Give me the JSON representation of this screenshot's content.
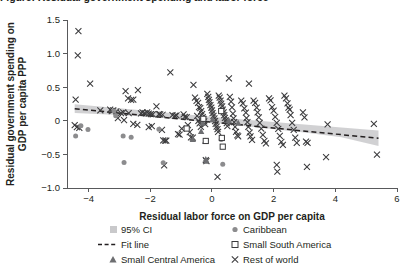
{
  "figure": {
    "title_partial": "Figure: Residual government spending and labor force",
    "background": "#ffffff"
  },
  "colors": {
    "ci_band": "#c9c9cb",
    "fit_line": "#231f20",
    "caribbean": "#8c8c8e",
    "small_central_america": "#6d6e71",
    "small_south_america": "#ffffff",
    "rest_of_world": "#3b3b3d",
    "axis": "#58595b",
    "text": "#231f20"
  },
  "axes": {
    "x": {
      "label": "Residual labor force on GDP per capita",
      "ticks": [
        "−4",
        "−2",
        "0",
        "2",
        "4",
        "6"
      ],
      "tick_values": [
        -4,
        -2,
        0,
        2,
        4,
        6
      ],
      "min": -4.7,
      "max": 6.0
    },
    "y": {
      "label_line1": "Residual government spending on",
      "label_line2": "GDP per capita PPP",
      "ticks": [
        "1.5",
        "1.0",
        "0.5",
        "0",
        "−0.5",
        "−1.0"
      ],
      "tick_values": [
        1.5,
        1.0,
        0.5,
        0,
        -0.5,
        -1.0
      ],
      "min": -1.0,
      "max": 1.5
    }
  },
  "legend": {
    "items": [
      {
        "label": "95% CI",
        "marker": "ci-swatch-icon",
        "column": "left",
        "row": 1
      },
      {
        "label": "Fit line",
        "marker": "dashed-line-icon",
        "column": "left",
        "row": 2
      },
      {
        "label": "Small Central America",
        "marker": "filled-triangle-icon",
        "column": "left",
        "row": 3
      },
      {
        "label": "Caribbean",
        "marker": "filled-circle-icon",
        "column": "right",
        "row": 1
      },
      {
        "label": "Small South America",
        "marker": "open-square-icon",
        "column": "right",
        "row": 2
      },
      {
        "label": "Rest of world",
        "marker": "cross-icon",
        "column": "right",
        "row": 3
      }
    ]
  },
  "chart_data": {
    "type": "scatter",
    "title": "",
    "xlabel": "Residual labor force on GDP per capita",
    "ylabel": "Residual government spending on GDP per capita PPP",
    "xlim": [
      -4.7,
      6.0
    ],
    "ylim": [
      -1.0,
      1.5
    ],
    "grid": false,
    "legend_position": "bottom",
    "fit_line": {
      "name": "Fit line",
      "style": "dashed",
      "x": [
        -4.45,
        5.4
      ],
      "y": [
        0.18,
        -0.26
      ],
      "slope": -0.0447,
      "intercept": -0.019
    },
    "confidence_interval": {
      "name": "95% CI",
      "level": 0.95,
      "x": [
        -4.45,
        -3.0,
        -1.5,
        0.0,
        1.5,
        3.0,
        4.2,
        5.4
      ],
      "upper": [
        0.245,
        0.185,
        0.125,
        0.06,
        0.0,
        -0.055,
        -0.1,
        -0.145
      ],
      "lower": [
        0.115,
        0.085,
        0.04,
        -0.03,
        -0.1,
        -0.175,
        -0.245,
        -0.375
      ]
    },
    "series": [
      {
        "name": "Rest of world",
        "marker": "x",
        "color": "#3b3b3d",
        "points": [
          [
            -4.33,
            1.335
          ],
          [
            -4.35,
            0.975
          ],
          [
            -3.95,
            0.555
          ],
          [
            -4.42,
            0.315
          ],
          [
            -4.45,
            -0.065
          ],
          [
            -4.38,
            -0.095
          ],
          [
            -4.3,
            -0.105
          ],
          [
            -3.62,
            0.155
          ],
          [
            -3.3,
            0.165
          ],
          [
            -3.25,
            0.145
          ],
          [
            -3.2,
            0.155
          ],
          [
            -3.1,
            0.14
          ],
          [
            -3.05,
            0.04
          ],
          [
            -2.95,
            0.115
          ],
          [
            -2.88,
            0.125
          ],
          [
            -2.8,
            0.44
          ],
          [
            -2.72,
            0.335
          ],
          [
            -2.62,
            0.31
          ],
          [
            -2.55,
            0.315
          ],
          [
            -2.4,
            0.455
          ],
          [
            -2.3,
            0.11
          ],
          [
            -2.25,
            0.125
          ],
          [
            -2.18,
            0.115
          ],
          [
            -2.1,
            0.125
          ],
          [
            -2.05,
            0.105
          ],
          [
            -1.98,
            0.1
          ],
          [
            -1.92,
            0.095
          ],
          [
            -2.85,
            0.01
          ],
          [
            -2.7,
            0.115
          ],
          [
            -2.55,
            -0.045
          ],
          [
            -2.42,
            -0.06
          ],
          [
            -2.05,
            -0.095
          ],
          [
            -1.95,
            -0.08
          ],
          [
            -1.8,
            0.215
          ],
          [
            -1.72,
            0.1
          ],
          [
            -1.68,
            0.095
          ],
          [
            -1.6,
            0.09
          ],
          [
            -1.62,
            -0.135
          ],
          [
            -1.58,
            -0.29
          ],
          [
            -1.52,
            -0.295
          ],
          [
            -1.48,
            -0.295
          ],
          [
            -1.55,
            -0.665
          ],
          [
            -1.35,
            0.72
          ],
          [
            -1.28,
            0.085
          ],
          [
            -1.2,
            0.075
          ],
          [
            -1.15,
            0.08
          ],
          [
            -1.1,
            -0.2
          ],
          [
            -1.05,
            -0.205
          ],
          [
            -0.98,
            -0.115
          ],
          [
            -0.92,
            0.095
          ],
          [
            -0.88,
            0.06
          ],
          [
            -0.82,
            0.055
          ],
          [
            -0.78,
            -0.065
          ],
          [
            -0.72,
            -0.17
          ],
          [
            -0.68,
            -0.245
          ],
          [
            -0.62,
            -0.25
          ],
          [
            -0.6,
            0.535
          ],
          [
            -0.55,
            0.345
          ],
          [
            -0.5,
            0.295
          ],
          [
            -0.45,
            0.265
          ],
          [
            -0.42,
            0.205
          ],
          [
            -0.38,
            0.19
          ],
          [
            -0.35,
            0.145
          ],
          [
            -0.32,
            0.1
          ],
          [
            -0.3,
            0.055
          ],
          [
            -0.28,
            0.02
          ],
          [
            -0.25,
            -0.01
          ],
          [
            -0.22,
            -0.05
          ],
          [
            -0.48,
            0.075
          ],
          [
            -0.44,
            0.0
          ],
          [
            -0.4,
            -0.04
          ],
          [
            -0.36,
            -0.09
          ],
          [
            -0.2,
            -0.585
          ],
          [
            -0.18,
            -0.6
          ],
          [
            -0.15,
            0.4
          ],
          [
            -0.12,
            0.355
          ],
          [
            -0.1,
            0.31
          ],
          [
            -0.08,
            0.275
          ],
          [
            -0.05,
            0.235
          ],
          [
            -0.02,
            0.195
          ],
          [
            0.0,
            0.155
          ],
          [
            0.02,
            0.115
          ],
          [
            0.05,
            0.075
          ],
          [
            0.08,
            0.035
          ],
          [
            0.1,
            -0.005
          ],
          [
            0.12,
            -0.045
          ],
          [
            0.15,
            -0.085
          ],
          [
            0.18,
            -0.125
          ],
          [
            0.2,
            -0.165
          ],
          [
            0.22,
            0.375
          ],
          [
            0.25,
            0.345
          ],
          [
            0.28,
            0.3
          ],
          [
            0.3,
            0.255
          ],
          [
            0.33,
            0.215
          ],
          [
            0.35,
            0.165
          ],
          [
            0.38,
            0.125
          ],
          [
            0.4,
            0.085
          ],
          [
            0.42,
            0.045
          ],
          [
            0.45,
            0.005
          ],
          [
            0.48,
            -0.035
          ],
          [
            0.5,
            -0.08
          ],
          [
            0.18,
            -0.835
          ],
          [
            0.55,
            0.63
          ],
          [
            0.58,
            0.355
          ],
          [
            0.62,
            0.285
          ],
          [
            0.65,
            0.2
          ],
          [
            0.68,
            0.105
          ],
          [
            0.7,
            0.035
          ],
          [
            0.72,
            -0.02
          ],
          [
            0.75,
            -0.09
          ],
          [
            0.78,
            -0.165
          ],
          [
            0.82,
            -0.215
          ],
          [
            0.85,
            -0.23
          ],
          [
            0.95,
            0.3
          ],
          [
            1.0,
            0.26
          ],
          [
            1.05,
            0.185
          ],
          [
            1.1,
            0.12
          ],
          [
            1.12,
            0.04
          ],
          [
            1.15,
            -0.02
          ],
          [
            1.18,
            -0.09
          ],
          [
            1.22,
            -0.175
          ],
          [
            1.25,
            -0.23
          ],
          [
            1.3,
            -0.285
          ],
          [
            1.2,
            0.555
          ],
          [
            1.35,
            0.3
          ],
          [
            1.4,
            0.265
          ],
          [
            1.45,
            0.195
          ],
          [
            1.48,
            0.125
          ],
          [
            1.52,
            0.05
          ],
          [
            1.55,
            -0.03
          ],
          [
            1.6,
            -0.115
          ],
          [
            1.65,
            -0.21
          ],
          [
            1.7,
            -0.3
          ],
          [
            1.75,
            -0.335
          ],
          [
            1.85,
            0.335
          ],
          [
            1.9,
            0.305
          ],
          [
            1.95,
            0.205
          ],
          [
            2.0,
            0.15
          ],
          [
            2.05,
            0.06
          ],
          [
            2.1,
            -0.03
          ],
          [
            2.15,
            -0.12
          ],
          [
            2.2,
            -0.225
          ],
          [
            2.25,
            -0.315
          ],
          [
            2.3,
            -0.36
          ],
          [
            2.1,
            -0.655
          ],
          [
            2.12,
            -0.755
          ],
          [
            2.35,
            0.375
          ],
          [
            2.4,
            0.335
          ],
          [
            2.45,
            0.26
          ],
          [
            2.48,
            0.195
          ],
          [
            2.52,
            0.165
          ],
          [
            2.55,
            0.085
          ],
          [
            2.6,
            -0.03
          ],
          [
            2.65,
            -0.135
          ],
          [
            2.7,
            -0.25
          ],
          [
            2.75,
            -0.33
          ],
          [
            2.95,
            0.125
          ],
          [
            3.0,
            0.05
          ],
          [
            3.05,
            -0.31
          ],
          [
            3.1,
            -0.33
          ],
          [
            3.08,
            -0.685
          ],
          [
            3.7,
            -0.54
          ],
          [
            3.75,
            -0.055
          ],
          [
            5.25,
            -0.045
          ],
          [
            5.35,
            -0.505
          ]
        ]
      },
      {
        "name": "Caribbean",
        "marker": "circle",
        "color": "#8c8c8e",
        "points": [
          [
            -4.42,
            -0.225
          ],
          [
            -4.25,
            -0.075
          ],
          [
            -4.02,
            -0.13
          ],
          [
            -3.18,
            0.145
          ],
          [
            -3.12,
            0.075
          ],
          [
            -2.88,
            -0.225
          ],
          [
            -2.62,
            -0.245
          ],
          [
            -2.85,
            -0.62
          ],
          [
            -1.72,
            -0.125
          ],
          [
            -1.58,
            -0.625
          ],
          [
            -0.3,
            0.0
          ],
          [
            0.3,
            -0.28
          ],
          [
            0.35,
            -0.645
          ]
        ]
      },
      {
        "name": "Small Central America",
        "marker": "triangle",
        "color": "#6d6e71",
        "points": [
          [
            -0.62,
            -0.275
          ],
          [
            -0.35,
            -0.155
          ],
          [
            -0.3,
            -0.035
          ],
          [
            -0.22,
            -0.3
          ],
          [
            -0.2,
            -0.57
          ],
          [
            -0.18,
            -0.6
          ],
          [
            0.02,
            0.02
          ],
          [
            0.55,
            0.005
          ],
          [
            0.85,
            -0.03
          ]
        ]
      },
      {
        "name": "Small South America",
        "marker": "square",
        "color": "#ffffff",
        "points": [
          [
            -0.82,
            -0.115
          ],
          [
            -0.28,
            0.03
          ],
          [
            -0.2,
            -0.3
          ],
          [
            0.3,
            0.145
          ],
          [
            0.32,
            -0.255
          ],
          [
            0.35,
            -0.385
          ]
        ]
      }
    ]
  }
}
